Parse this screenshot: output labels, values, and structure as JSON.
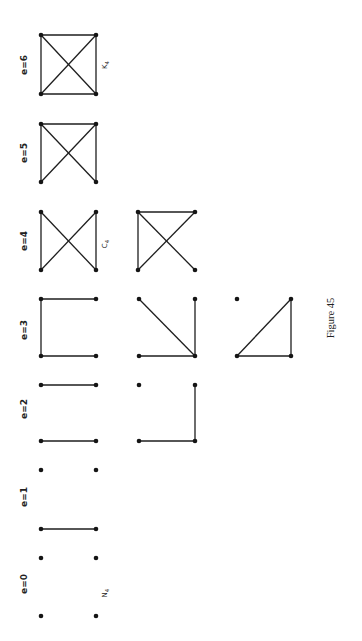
{
  "figure": {
    "caption": "Figure 45",
    "rotation": "page rotated 90deg counter-clockwise",
    "colors": {
      "ink": "#1e1e1e",
      "background": "#ffffff"
    }
  },
  "labels": [
    {
      "text": "e=6",
      "x": 27,
      "y": 65
    },
    {
      "text": "e=5",
      "x": 27,
      "y": 153
    },
    {
      "text": "e=4",
      "x": 27,
      "y": 241
    },
    {
      "text": "e=3",
      "x": 27,
      "y": 330
    },
    {
      "text": "e=2",
      "x": 27,
      "y": 409
    },
    {
      "text": "e=1",
      "x": 27,
      "y": 497
    },
    {
      "text": "e=0",
      "x": 27,
      "y": 584
    }
  ],
  "names": [
    {
      "text": "K4",
      "x": 107,
      "y": 65
    },
    {
      "text": "C4",
      "x": 107,
      "y": 244
    },
    {
      "text": "N4",
      "x": 107,
      "y": 593
    }
  ],
  "graphs": [
    {
      "id": "K4",
      "edges_count": 6,
      "nodes": [
        [
          41,
          35
        ],
        [
          96,
          35
        ],
        [
          41,
          94
        ],
        [
          96,
          94
        ]
      ],
      "edges": [
        [
          0,
          1
        ],
        [
          0,
          2
        ],
        [
          1,
          3
        ],
        [
          2,
          3
        ],
        [
          0,
          3
        ],
        [
          1,
          2
        ]
      ]
    },
    {
      "id": "e5",
      "edges_count": 5,
      "nodes": [
        [
          41,
          124
        ],
        [
          96,
          124
        ],
        [
          41,
          182
        ],
        [
          96,
          182
        ]
      ],
      "edges": [
        [
          0,
          1
        ],
        [
          0,
          2
        ],
        [
          1,
          3
        ],
        [
          0,
          3
        ],
        [
          1,
          2
        ]
      ]
    },
    {
      "id": "C4",
      "edges_count": 4,
      "nodes": [
        [
          41,
          212
        ],
        [
          96,
          212
        ],
        [
          41,
          270
        ],
        [
          96,
          270
        ]
      ],
      "edges": [
        [
          0,
          2
        ],
        [
          1,
          3
        ],
        [
          0,
          3
        ],
        [
          1,
          2
        ]
      ]
    },
    {
      "id": "e4b",
      "edges_count": 4,
      "nodes": [
        [
          138,
          212
        ],
        [
          195,
          212
        ],
        [
          138,
          270
        ],
        [
          195,
          270
        ]
      ],
      "edges": [
        [
          0,
          1
        ],
        [
          0,
          2
        ],
        [
          0,
          3
        ],
        [
          1,
          2
        ]
      ]
    },
    {
      "id": "e3a",
      "edges_count": 3,
      "nodes": [
        [
          41,
          299
        ],
        [
          96,
          299
        ],
        [
          41,
          356
        ],
        [
          96,
          356
        ]
      ],
      "edges": [
        [
          0,
          1
        ],
        [
          0,
          2
        ],
        [
          2,
          3
        ]
      ]
    },
    {
      "id": "e3b",
      "edges_count": 3,
      "nodes": [
        [
          139,
          299
        ],
        [
          195,
          299
        ],
        [
          139,
          356
        ],
        [
          195,
          356
        ]
      ],
      "edges": [
        [
          0,
          3
        ],
        [
          1,
          3
        ],
        [
          2,
          3
        ]
      ]
    },
    {
      "id": "e3c",
      "edges_count": 3,
      "nodes": [
        [
          237,
          299
        ],
        [
          291,
          299
        ],
        [
          237,
          356
        ],
        [
          291,
          356
        ]
      ],
      "edges": [
        [
          1,
          2
        ],
        [
          1,
          3
        ],
        [
          2,
          3
        ]
      ]
    },
    {
      "id": "e2a",
      "edges_count": 2,
      "nodes": [
        [
          41,
          385
        ],
        [
          96,
          385
        ],
        [
          41,
          441
        ],
        [
          96,
          441
        ]
      ],
      "edges": [
        [
          0,
          1
        ],
        [
          2,
          3
        ]
      ]
    },
    {
      "id": "e2b",
      "edges_count": 2,
      "nodes": [
        [
          139,
          385
        ],
        [
          195,
          385
        ],
        [
          139,
          441
        ],
        [
          195,
          441
        ]
      ],
      "edges": [
        [
          1,
          3
        ],
        [
          2,
          3
        ]
      ]
    },
    {
      "id": "e1",
      "edges_count": 1,
      "nodes": [
        [
          41,
          470
        ],
        [
          96,
          470
        ],
        [
          41,
          529
        ],
        [
          96,
          529
        ]
      ],
      "edges": [
        [
          2,
          3
        ]
      ]
    },
    {
      "id": "N4",
      "edges_count": 0,
      "nodes": [
        [
          41,
          558
        ],
        [
          96,
          558
        ],
        [
          41,
          616
        ],
        [
          96,
          616
        ]
      ],
      "edges": []
    }
  ]
}
